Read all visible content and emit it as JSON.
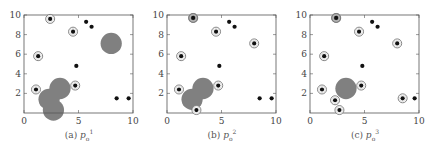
{
  "chart_data": [
    {
      "type": "scatter",
      "title": "(a) p_o^1",
      "caption": {
        "prefix": "(a)",
        "symbol": "p",
        "sub": "o",
        "sup": "1"
      },
      "xlim": [
        0,
        10
      ],
      "ylim": [
        0,
        10
      ],
      "xticks": [
        0,
        5,
        10
      ],
      "yticks": [
        2,
        4,
        6,
        8,
        10
      ],
      "grid": false,
      "points": [
        {
          "x": 2.4,
          "y": 9.6,
          "ring": true
        },
        {
          "x": 5.7,
          "y": 9.3,
          "ring": false
        },
        {
          "x": 6.2,
          "y": 8.8,
          "ring": false
        },
        {
          "x": 4.5,
          "y": 8.3,
          "ring": true
        },
        {
          "x": 1.3,
          "y": 5.8,
          "ring": true
        },
        {
          "x": 4.8,
          "y": 4.8,
          "ring": false
        },
        {
          "x": 1.1,
          "y": 2.4,
          "ring": true
        },
        {
          "x": 4.7,
          "y": 2.8,
          "ring": true
        },
        {
          "x": 8.5,
          "y": 1.5,
          "ring": false
        },
        {
          "x": 9.6,
          "y": 1.5,
          "ring": false
        }
      ],
      "blobs": [
        {
          "x": 8.0,
          "y": 7.1,
          "r": 1.3
        },
        {
          "x": 3.3,
          "y": 2.5,
          "r": 1.3
        },
        {
          "x": 2.3,
          "y": 1.4,
          "r": 1.3
        },
        {
          "x": 2.7,
          "y": 0.3,
          "r": 1.3
        }
      ]
    },
    {
      "type": "scatter",
      "title": "(b) p_o^2",
      "caption": {
        "prefix": "(b)",
        "symbol": "p",
        "sub": "o",
        "sup": "2"
      },
      "xlim": [
        0,
        10
      ],
      "ylim": [
        0,
        10
      ],
      "xticks": [
        0,
        5,
        10
      ],
      "yticks": [
        2,
        4,
        6,
        8,
        10
      ],
      "grid": false,
      "points": [
        {
          "x": 2.4,
          "y": 9.7,
          "ring": true,
          "heavy": true
        },
        {
          "x": 5.7,
          "y": 9.3,
          "ring": false
        },
        {
          "x": 6.2,
          "y": 8.8,
          "ring": false
        },
        {
          "x": 4.5,
          "y": 8.3,
          "ring": true
        },
        {
          "x": 8.0,
          "y": 7.1,
          "ring": true
        },
        {
          "x": 1.3,
          "y": 5.8,
          "ring": true
        },
        {
          "x": 4.8,
          "y": 4.8,
          "ring": false
        },
        {
          "x": 1.1,
          "y": 2.4,
          "ring": true
        },
        {
          "x": 4.7,
          "y": 2.8,
          "ring": true
        },
        {
          "x": 2.7,
          "y": 0.3,
          "ring": true
        },
        {
          "x": 8.5,
          "y": 1.5,
          "ring": false
        },
        {
          "x": 9.6,
          "y": 1.5,
          "ring": false
        }
      ],
      "blobs": [
        {
          "x": 3.3,
          "y": 2.5,
          "r": 1.3
        },
        {
          "x": 2.3,
          "y": 1.4,
          "r": 1.3
        }
      ]
    },
    {
      "type": "scatter",
      "title": "(c) p_o^3",
      "caption": {
        "prefix": "(c)",
        "symbol": "p",
        "sub": "o",
        "sup": "3"
      },
      "xlim": [
        0,
        10
      ],
      "ylim": [
        0,
        10
      ],
      "xticks": [
        0,
        5,
        10
      ],
      "yticks": [
        2,
        4,
        6,
        8,
        10
      ],
      "grid": false,
      "points": [
        {
          "x": 2.4,
          "y": 9.7,
          "ring": true,
          "heavy": true
        },
        {
          "x": 5.7,
          "y": 9.3,
          "ring": false
        },
        {
          "x": 6.2,
          "y": 8.8,
          "ring": false
        },
        {
          "x": 4.5,
          "y": 8.3,
          "ring": true
        },
        {
          "x": 8.0,
          "y": 7.1,
          "ring": true
        },
        {
          "x": 1.3,
          "y": 5.8,
          "ring": true
        },
        {
          "x": 4.8,
          "y": 4.8,
          "ring": false
        },
        {
          "x": 1.1,
          "y": 2.4,
          "ring": true
        },
        {
          "x": 4.7,
          "y": 2.8,
          "ring": true
        },
        {
          "x": 2.3,
          "y": 1.3,
          "ring": true
        },
        {
          "x": 2.7,
          "y": 0.3,
          "ring": true
        },
        {
          "x": 8.5,
          "y": 1.5,
          "ring": true
        },
        {
          "x": 9.6,
          "y": 1.5,
          "ring": false
        }
      ],
      "blobs": [
        {
          "x": 3.3,
          "y": 2.5,
          "r": 1.3
        }
      ]
    }
  ],
  "style": {
    "dot_color": "#111111",
    "ring_color": "#777777",
    "blob_color": "#808080",
    "axis_color": "#555555"
  }
}
